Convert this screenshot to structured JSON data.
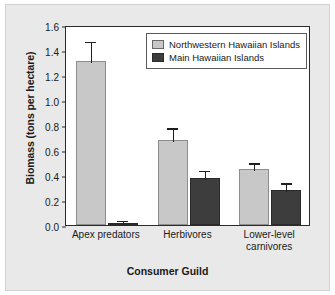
{
  "chart_data": {
    "type": "bar",
    "title": "",
    "xlabel": "Consumer Guild",
    "ylabel": "Biomass (tons per hectare)",
    "categories": [
      "Apex predators",
      "Herbivores",
      "Lower-level carnivores"
    ],
    "category_lines": [
      [
        "Apex predators"
      ],
      [
        "Herbivores"
      ],
      [
        "Lower-level",
        "carnivores"
      ]
    ],
    "series": [
      {
        "name": "Northwestern Hawaiian Islands",
        "color": "#c8c8c8",
        "values": [
          1.31,
          0.68,
          0.445
        ],
        "errors_upper": [
          1.48,
          0.79,
          0.51
        ],
        "errors_lower": [
          1.14,
          0.57,
          0.38
        ]
      },
      {
        "name": "Main Hawaiian Islands",
        "color": "#3d3d3d",
        "values": [
          0.02,
          0.38,
          0.28
        ],
        "errors_upper": [
          0.05,
          0.45,
          0.35
        ],
        "errors_lower": [
          0.0,
          0.31,
          0.21
        ]
      }
    ],
    "ylim": [
      0.0,
      1.6
    ],
    "ytick_values": [
      0.0,
      0.2,
      0.4,
      0.6,
      0.8,
      1.0,
      1.2,
      1.4,
      1.6
    ],
    "ytick_labels": [
      "0.0",
      "0.2",
      "0.4",
      "0.6",
      "0.8",
      "1.0",
      "1.2",
      "1.4",
      "1.6"
    ],
    "grid": false,
    "legend_position": "top-right-inside",
    "legend_entries": [
      "Northwestern Hawaiian Islands",
      "Main Hawaiian Islands"
    ]
  }
}
